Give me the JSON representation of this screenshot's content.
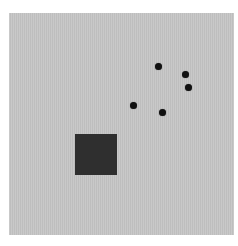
{
  "scene": {
    "background_color": "#ffffff",
    "panel": {
      "color": "#c6c6c6",
      "x": 9,
      "y": 13,
      "width": 225,
      "height": 222
    },
    "square": {
      "color": "#2f2f2f",
      "x": 75,
      "y": 134,
      "width": 42,
      "height": 41
    },
    "dots": [
      {
        "cx": 158,
        "cy": 66,
        "r": 3.5
      },
      {
        "cx": 185,
        "cy": 74,
        "r": 3.5
      },
      {
        "cx": 188,
        "cy": 87,
        "r": 3.5
      },
      {
        "cx": 133,
        "cy": 105,
        "r": 3.5
      },
      {
        "cx": 162,
        "cy": 112,
        "r": 3.5
      }
    ],
    "dot_color": "#111111"
  }
}
